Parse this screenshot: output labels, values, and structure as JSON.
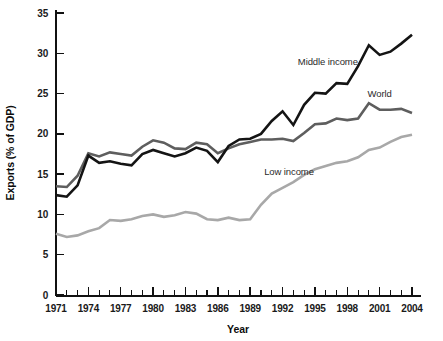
{
  "chart_data": {
    "type": "line",
    "title": "",
    "xlabel": "Year",
    "ylabel": "Exports (% of GDP)",
    "xlim": [
      1971,
      2004
    ],
    "ylim": [
      0,
      35
    ],
    "grid": false,
    "legend_position": "inline-annotations",
    "x": [
      1971,
      1972,
      1973,
      1974,
      1975,
      1976,
      1977,
      1978,
      1979,
      1980,
      1981,
      1982,
      1983,
      1984,
      1985,
      1986,
      1987,
      1988,
      1989,
      1990,
      1991,
      1992,
      1993,
      1994,
      1995,
      1996,
      1997,
      1998,
      1999,
      2000,
      2001,
      2002,
      2003,
      2004
    ],
    "xticks": [
      1971,
      1972,
      1973,
      1974,
      1975,
      1976,
      1977,
      1978,
      1979,
      1980,
      1981,
      1982,
      1983,
      1984,
      1985,
      1986,
      1987,
      1988,
      1989,
      1990,
      1991,
      1992,
      1993,
      1994,
      1995,
      1996,
      1997,
      1998,
      1999,
      2000,
      2001,
      2002,
      2003,
      2004
    ],
    "xtick_labels_shown": [
      "1971",
      "1974",
      "1977",
      "1980",
      "1983",
      "1986",
      "1989",
      "1992",
      "1995",
      "1998",
      "2001",
      "2004"
    ],
    "yticks": [
      0,
      5,
      10,
      15,
      20,
      25,
      30,
      35
    ],
    "ytick_labels": [
      "0",
      "5",
      "10",
      "15",
      "20",
      "25",
      "30",
      "35"
    ],
    "series": [
      {
        "name": "Middle income",
        "color": "#141414",
        "stroke_width": 2.6,
        "label_x": 1996.2,
        "label_y": 28.6,
        "values": [
          12.4,
          12.2,
          13.6,
          17.3,
          16.4,
          16.6,
          16.3,
          16.1,
          17.5,
          18.0,
          17.6,
          17.2,
          17.6,
          18.3,
          17.9,
          16.5,
          18.5,
          19.3,
          19.4,
          20.0,
          21.6,
          22.8,
          21.1,
          23.6,
          25.1,
          25.0,
          26.3,
          26.2,
          28.4,
          31.0,
          29.8,
          30.2,
          31.2,
          32.3
        ]
      },
      {
        "name": "World",
        "color": "#5e5e5e",
        "stroke_width": 2.6,
        "label_x": 2001.0,
        "label_y": 24.6,
        "values": [
          13.5,
          13.4,
          14.8,
          17.6,
          17.2,
          17.7,
          17.5,
          17.3,
          18.4,
          19.2,
          18.9,
          18.2,
          18.1,
          18.9,
          18.7,
          17.6,
          18.2,
          18.7,
          19.0,
          19.3,
          19.3,
          19.4,
          19.1,
          20.1,
          21.2,
          21.3,
          21.9,
          21.7,
          21.9,
          23.8,
          23.0,
          23.0,
          23.1,
          22.6
        ]
      },
      {
        "name": "Low income",
        "color": "#a8a8a8",
        "stroke_width": 2.6,
        "label_x": 1992.6,
        "label_y": 14.9,
        "values": [
          7.6,
          7.2,
          7.4,
          7.9,
          8.3,
          9.3,
          9.2,
          9.4,
          9.8,
          10.0,
          9.7,
          9.9,
          10.3,
          10.1,
          9.4,
          9.3,
          9.6,
          9.3,
          9.4,
          11.2,
          12.6,
          13.3,
          14.0,
          14.9,
          15.6,
          16.0,
          16.4,
          16.6,
          17.1,
          18.0,
          18.3,
          19.0,
          19.6,
          19.9
        ]
      }
    ]
  },
  "axes": {
    "y_title": "Exports (% of GDP)",
    "x_title": "Year"
  }
}
